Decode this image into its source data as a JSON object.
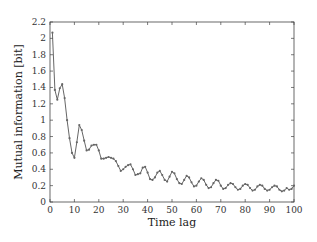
{
  "chart_data": {
    "type": "line",
    "title": "",
    "xlabel": "Time lag",
    "ylabel": "Mutual information [bit]",
    "xlim": [
      0,
      100
    ],
    "ylim": [
      0,
      2.2
    ],
    "xticks": [
      0,
      10,
      20,
      30,
      40,
      50,
      60,
      70,
      80,
      90,
      100
    ],
    "yticks": [
      0,
      0.2,
      0.4,
      0.6,
      0.8,
      1,
      1.2,
      1.4,
      1.6,
      1.8,
      2,
      2.2
    ],
    "xtick_labels": [
      "0",
      "10",
      "20",
      "30",
      "40",
      "50",
      "60",
      "70",
      "80",
      "90",
      "100"
    ],
    "ytick_labels": [
      "0",
      "0.2",
      "0.4",
      "0.6",
      "0.8",
      "1",
      "1.2",
      "1.4",
      "1.6",
      "1.8",
      "2",
      "2.2"
    ],
    "grid": false,
    "legend": null,
    "marker": "small dots",
    "line_color": "#555555",
    "series": [
      {
        "name": "Mutual information",
        "x": [
          1,
          2,
          3,
          4,
          5,
          6,
          7,
          8,
          9,
          10,
          11,
          12,
          13,
          14,
          15,
          16,
          17,
          18,
          19,
          20,
          21,
          22,
          23,
          24,
          25,
          26,
          27,
          28,
          29,
          30,
          31,
          32,
          33,
          34,
          35,
          36,
          37,
          38,
          39,
          40,
          41,
          42,
          43,
          44,
          45,
          46,
          47,
          48,
          49,
          50,
          51,
          52,
          53,
          54,
          55,
          56,
          57,
          58,
          59,
          60,
          61,
          62,
          63,
          64,
          65,
          66,
          67,
          68,
          69,
          70,
          71,
          72,
          73,
          74,
          75,
          76,
          77,
          78,
          79,
          80,
          81,
          82,
          83,
          84,
          85,
          86,
          87,
          88,
          89,
          90,
          91,
          92,
          93,
          94,
          95,
          96,
          97,
          98,
          99,
          100
        ],
        "values": [
          2.07,
          1.37,
          1.25,
          1.39,
          1.44,
          1.27,
          1.0,
          0.78,
          0.6,
          0.54,
          0.73,
          0.94,
          0.88,
          0.75,
          0.63,
          0.64,
          0.69,
          0.7,
          0.7,
          0.63,
          0.53,
          0.53,
          0.54,
          0.55,
          0.54,
          0.53,
          0.5,
          0.44,
          0.38,
          0.4,
          0.43,
          0.45,
          0.46,
          0.4,
          0.33,
          0.34,
          0.35,
          0.42,
          0.43,
          0.36,
          0.28,
          0.27,
          0.3,
          0.36,
          0.38,
          0.33,
          0.27,
          0.25,
          0.31,
          0.37,
          0.35,
          0.28,
          0.23,
          0.22,
          0.27,
          0.32,
          0.3,
          0.24,
          0.19,
          0.2,
          0.25,
          0.29,
          0.27,
          0.21,
          0.17,
          0.18,
          0.23,
          0.27,
          0.26,
          0.2,
          0.16,
          0.17,
          0.21,
          0.23,
          0.22,
          0.18,
          0.15,
          0.16,
          0.2,
          0.22,
          0.21,
          0.17,
          0.14,
          0.15,
          0.19,
          0.21,
          0.2,
          0.16,
          0.14,
          0.15,
          0.18,
          0.2,
          0.19,
          0.15,
          0.13,
          0.14,
          0.17,
          0.15,
          0.16,
          0.2
        ]
      }
    ]
  }
}
